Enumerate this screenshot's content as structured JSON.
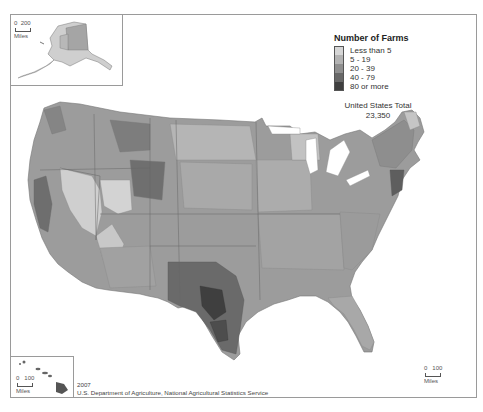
{
  "legend": {
    "title": "Number of Farms",
    "items": [
      {
        "label": "Less than 5",
        "color": "#d6d6d6"
      },
      {
        "label": "5 - 19",
        "color": "#b3b3b3"
      },
      {
        "label": "20 - 39",
        "color": "#8f8f8f"
      },
      {
        "label": "40 - 79",
        "color": "#686868"
      },
      {
        "label": "80 or more",
        "color": "#3f3f3f"
      }
    ]
  },
  "total": {
    "label": "United States Total",
    "value": "23,350"
  },
  "scales": {
    "alaska": {
      "zero": "0",
      "distance": "200",
      "unit": "Miles"
    },
    "hawaii": {
      "zero": "0",
      "distance": "100",
      "unit": "Miles"
    },
    "conus": {
      "zero": "0",
      "distance": "100",
      "unit": "Miles"
    }
  },
  "source": {
    "year": "2007",
    "agency": "U.S. Department of Agriculture, National Agricultural Statistics Service"
  },
  "regions": {
    "conus": "Contiguous United States",
    "alaska": "Alaska",
    "hawaii": "Hawaii"
  }
}
